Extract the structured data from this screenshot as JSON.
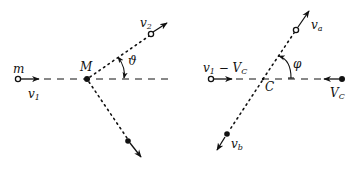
{
  "left_panel": {
    "name": "lab-frame",
    "labels": {
      "m": "m",
      "M": "M",
      "v1": "v",
      "v1_sub": "1",
      "v2": "v",
      "v2_sub": "2",
      "theta": "ϑ"
    },
    "colors": {
      "ink": "#111111",
      "background": "#ffffff"
    }
  },
  "right_panel": {
    "name": "center-of-mass-frame",
    "labels": {
      "v1_minus_Vc": "v",
      "v1_minus_Vc_sub": "1",
      "minus": " − V",
      "minus_sub": "C",
      "C": "C",
      "Vc": "V",
      "Vc_sub": "C",
      "va": "v",
      "va_sub": "a",
      "vb": "v",
      "vb_sub": "b",
      "phi": "φ"
    },
    "colors": {
      "ink": "#111111",
      "background": "#ffffff"
    }
  }
}
